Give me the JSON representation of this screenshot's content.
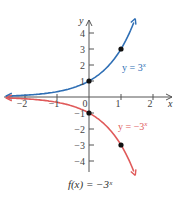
{
  "chart_data": {
    "type": "line",
    "title": "",
    "caption": "f(x) = −3ˣ",
    "xlabel": "x",
    "ylabel": "y",
    "xlim": [
      -2.6,
      2.6
    ],
    "ylim": [
      -4.9,
      4.9
    ],
    "x_ticks": [
      -2,
      -1,
      0,
      1,
      2
    ],
    "y_ticks": [
      -4,
      -3,
      -2,
      -1,
      1,
      2,
      3,
      4
    ],
    "x_tick_labels": [
      "−2",
      "−1",
      "0",
      "1",
      "2"
    ],
    "y_tick_labels": [
      "−4",
      "−3",
      "−2",
      "−1",
      "1",
      "2",
      "3",
      "4"
    ],
    "grid": false,
    "series": [
      {
        "name": "y = 3ˣ",
        "label": "y = 3",
        "label_exp": "x",
        "color": "#2f6fb5",
        "formula": "3^x",
        "points": [
          [
            0,
            1
          ],
          [
            1,
            3
          ]
        ]
      },
      {
        "name": "y = −3ˣ",
        "label": "y = −3",
        "label_exp": "x",
        "color": "#e05a5a",
        "formula": "-3^x",
        "points": [
          [
            0,
            -1
          ],
          [
            1,
            -3
          ]
        ]
      }
    ]
  }
}
